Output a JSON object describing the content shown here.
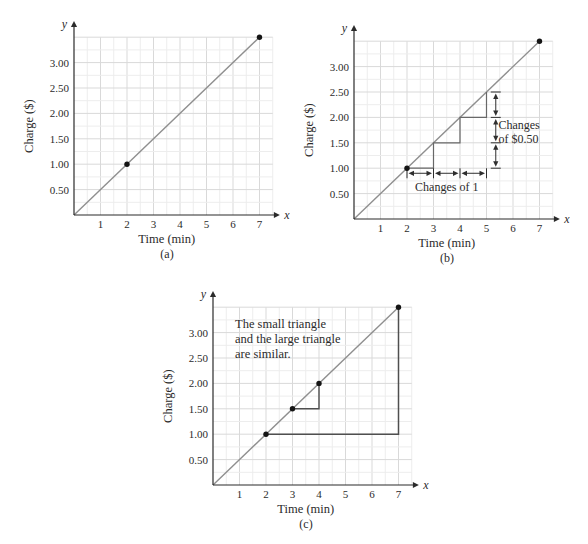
{
  "figure": {
    "background": "#ffffff",
    "description_visible_text_only": true
  },
  "colors": {
    "grid_minor": "#ededed",
    "grid_major": "#d9d9d9",
    "axis": "#2b2b2b",
    "trend_line": "#8f8f8f",
    "point": "#141414",
    "staircase": "#686868",
    "triangle": "#4f4f4f",
    "measure": "#2f2f2f",
    "text": "#2b2b2b"
  },
  "chart_data": [
    {
      "id": "a",
      "type": "line",
      "caption": "(a)",
      "xlabel": "Time (min)",
      "ylabel": "Charge ($)",
      "x_axis_letter": "x",
      "y_axis_letter": "y",
      "xlim": [
        0,
        7.5
      ],
      "ylim": [
        0,
        3.5
      ],
      "x_tick_values": [
        1,
        2,
        3,
        4,
        5,
        6,
        7
      ],
      "x_tick_labels": [
        "1",
        "2",
        "3",
        "4",
        "5",
        "6",
        "7"
      ],
      "y_tick_values": [
        0.5,
        1,
        1.5,
        2,
        2.5,
        3
      ],
      "y_tick_labels": [
        "0.50",
        "1.00",
        "1.50",
        "2.00",
        "2.50",
        "3.00"
      ],
      "grid": {
        "x_minor_step": 0.5,
        "x_major_step": 1,
        "y_minor_step": 0.25,
        "y_major_step": 0.5
      },
      "line": {
        "from": [
          0,
          0
        ],
        "to": [
          7,
          3.5
        ]
      },
      "points": [
        [
          2,
          1
        ],
        [
          7,
          3.5
        ]
      ]
    },
    {
      "id": "b",
      "type": "line",
      "caption": "(b)",
      "xlabel": "Time (min)",
      "ylabel": "Charge ($)",
      "x_axis_letter": "x",
      "y_axis_letter": "y",
      "xlim": [
        0,
        7.5
      ],
      "ylim": [
        0,
        3.5
      ],
      "x_tick_values": [
        1,
        2,
        3,
        4,
        5,
        6,
        7
      ],
      "x_tick_labels": [
        "1",
        "2",
        "3",
        "4",
        "5",
        "6",
        "7"
      ],
      "y_tick_values": [
        0.5,
        1,
        1.5,
        2,
        2.5,
        3
      ],
      "y_tick_labels": [
        "0.50",
        "1.00",
        "1.50",
        "2.00",
        "2.50",
        "3.00"
      ],
      "grid": {
        "x_minor_step": 0.5,
        "x_major_step": 1,
        "y_minor_step": 0.25,
        "y_major_step": 0.5
      },
      "line": {
        "from": [
          0,
          0
        ],
        "to": [
          7,
          3.5
        ]
      },
      "points": [
        [
          2,
          1
        ],
        [
          7,
          3.5
        ]
      ],
      "staircase": [
        [
          2,
          1
        ],
        [
          3,
          1
        ],
        [
          3,
          1.5
        ],
        [
          4,
          1.5
        ],
        [
          4,
          2
        ],
        [
          5,
          2
        ],
        [
          5,
          2.5
        ]
      ],
      "x_measure": {
        "y": 0.9,
        "ticks": [
          2,
          3,
          4,
          5
        ],
        "label": "Changes of 1",
        "label_x": 3.5,
        "label_y": 0.55
      },
      "y_measure": {
        "x": 5.35,
        "ticks": [
          1,
          1.5,
          2,
          2.5
        ],
        "label_lines": [
          "Changes",
          "of $0.50"
        ],
        "label_x": 5.45,
        "label_y": 1.78
      }
    },
    {
      "id": "c",
      "type": "line",
      "caption": "(c)",
      "xlabel": "Time (min)",
      "ylabel": "Charge ($)",
      "x_axis_letter": "x",
      "y_axis_letter": "y",
      "xlim": [
        0,
        7.5
      ],
      "ylim": [
        0,
        3.5
      ],
      "x_tick_values": [
        1,
        2,
        3,
        4,
        5,
        6,
        7
      ],
      "x_tick_labels": [
        "1",
        "2",
        "3",
        "4",
        "5",
        "6",
        "7"
      ],
      "y_tick_values": [
        0.5,
        1,
        1.5,
        2,
        2.5,
        3
      ],
      "y_tick_labels": [
        "0.50",
        "1.00",
        "1.50",
        "2.00",
        "2.50",
        "3.00"
      ],
      "grid": {
        "x_minor_step": 0.5,
        "x_major_step": 1,
        "y_minor_step": 0.25,
        "y_major_step": 0.5
      },
      "line": {
        "from": [
          0,
          0
        ],
        "to": [
          7,
          3.5
        ]
      },
      "points": [
        [
          2,
          1
        ],
        [
          3,
          1.5
        ],
        [
          4,
          2
        ],
        [
          7,
          3.5
        ]
      ],
      "triangles": {
        "small": [
          [
            3,
            1.5
          ],
          [
            4,
            1.5
          ],
          [
            4,
            2
          ]
        ],
        "large": [
          [
            2,
            1
          ],
          [
            7,
            1
          ],
          [
            7,
            3.5
          ]
        ]
      },
      "note": {
        "lines": [
          "The small triangle",
          "and the large triangle",
          "are similar."
        ],
        "x": 0.83,
        "y": 3.1
      }
    }
  ]
}
